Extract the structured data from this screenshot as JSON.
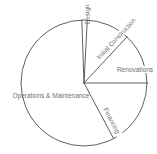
{
  "chart_data": {
    "type": "pie",
    "title": "",
    "legend": "none",
    "fill_style": "unfilled-outline-only",
    "slices": [
      {
        "label": "Renovations",
        "percent": 13.1,
        "start_deg": 0,
        "end_deg": 47
      },
      {
        "label": "Initial Construction",
        "percent": 11.1,
        "start_deg": 47,
        "end_deg": 87
      },
      {
        "label": "Design",
        "percent": 1.4,
        "start_deg": 87,
        "end_deg": 92
      },
      {
        "label": "Operations & Maintenance",
        "percent": 57.2,
        "start_deg": 92,
        "end_deg": 298
      },
      {
        "label": "Financing",
        "percent": 17.2,
        "start_deg": 298,
        "end_deg": 360
      }
    ],
    "style": {
      "background": "#ffffff",
      "stroke": "#4d4d4d",
      "label_color": "#6f6f6f"
    }
  }
}
